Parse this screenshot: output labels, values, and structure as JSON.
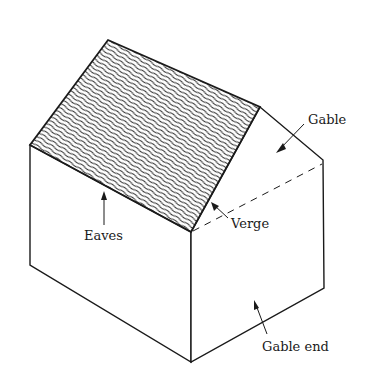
{
  "figure": {
    "type": "isometric house diagram",
    "colors": {
      "line": "#1a1a1a",
      "background": "#ffffff",
      "roof_hatch": "#2a2a2a"
    }
  },
  "labels": {
    "gable": "Gable",
    "eaves": "Eaves",
    "verge": "Verge",
    "gable_end": "Gable end"
  }
}
